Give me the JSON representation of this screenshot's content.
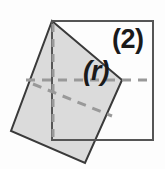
{
  "figure": {
    "width": 165,
    "height": 169,
    "background_color": "#fdfdfd",
    "labels": {
      "step_number": "(2)",
      "radius_symbol": "(r)"
    },
    "colors": {
      "fill_gray": "#d9d9d9",
      "outline_dark": "#3a3a3a",
      "dashed_gray": "#999999",
      "text_dark": "#1a1a1a"
    },
    "shapes": {
      "outer_square": {
        "name": "upright-square",
        "stroke": "#555555",
        "stroke_width": 2,
        "fill": "none",
        "points": "52,21 153,21 153,140 52,140"
      },
      "tilted_square": {
        "name": "rotated-square",
        "stroke": "#3a3a3a",
        "stroke_width": 2,
        "fill": "#d9d9d9",
        "points": "52,21 122,80 85,163 11,131"
      }
    },
    "dashed_lines": [
      {
        "name": "vertical-center-line",
        "x1": 53,
        "y1": 24,
        "x2": 53,
        "y2": 141
      },
      {
        "name": "horizontal-center-line",
        "x1": 26,
        "y1": 80,
        "x2": 152,
        "y2": 80
      },
      {
        "name": "diagonal-radius-line",
        "x1": 33,
        "y1": 84,
        "x2": 112,
        "y2": 116
      }
    ]
  }
}
